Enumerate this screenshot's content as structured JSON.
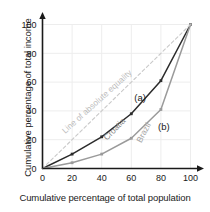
{
  "chart_data": {
    "type": "line",
    "title": "",
    "xlabel": "Cumulative percentage of total population",
    "ylabel": "Cumulative percentage of total income",
    "xlim": [
      0,
      100
    ],
    "ylim": [
      0,
      100
    ],
    "xticks": [
      "0",
      "20",
      "40",
      "60",
      "80",
      "100"
    ],
    "yticks": [
      "0",
      "20",
      "40",
      "60",
      "80",
      "100"
    ],
    "xtick_values": [
      0,
      20,
      40,
      60,
      80,
      100
    ],
    "ytick_values": [
      0,
      20,
      40,
      60,
      80,
      100
    ],
    "grid": true,
    "legend_position": "inline-annotations",
    "x": [
      0,
      20,
      40,
      60,
      80,
      100
    ],
    "series": [
      {
        "name": "Croatia",
        "label": "(a)",
        "color": "#2b2b2b",
        "values": [
          0,
          10,
          22,
          38,
          61,
          100
        ]
      },
      {
        "name": "Brazil",
        "label": "(b)",
        "color": "#9a9a9a",
        "values": [
          0,
          4,
          10,
          21,
          41,
          100
        ]
      },
      {
        "name": "Line of absolute equality",
        "label": "",
        "color": "#c9c9c9",
        "values": [
          0,
          20,
          40,
          60,
          80,
          100
        ],
        "style": "dashed"
      }
    ],
    "annotations": [
      {
        "text": "Line of absolute equality",
        "x": 38,
        "y": 45,
        "rotation": -42,
        "color": "#bdbdbd"
      },
      {
        "text": "Croatia",
        "x": 50,
        "y": 26,
        "rotation": -46,
        "color": "#8a8a8a"
      },
      {
        "text": "Brazil",
        "x": 70,
        "y": 24,
        "rotation": -62,
        "color": "#a5a5a5"
      },
      {
        "text": "(a)",
        "x": 66,
        "y": 47,
        "rotation": 0,
        "color": "#1a1a1a"
      },
      {
        "text": "(b)",
        "x": 82,
        "y": 27,
        "rotation": 0,
        "color": "#1a1a1a"
      }
    ]
  },
  "axes": {
    "x_title": "Cumulative percentage of total population",
    "y_title": "Cumulative percentage of total income"
  },
  "colors": {
    "croatia": "#2b2b2b",
    "brazil": "#9a9a9a",
    "equality": "#c9c9c9",
    "grid": "#ededed",
    "axis": "#1a1a1a",
    "tick_label": "#1a1a1a"
  }
}
